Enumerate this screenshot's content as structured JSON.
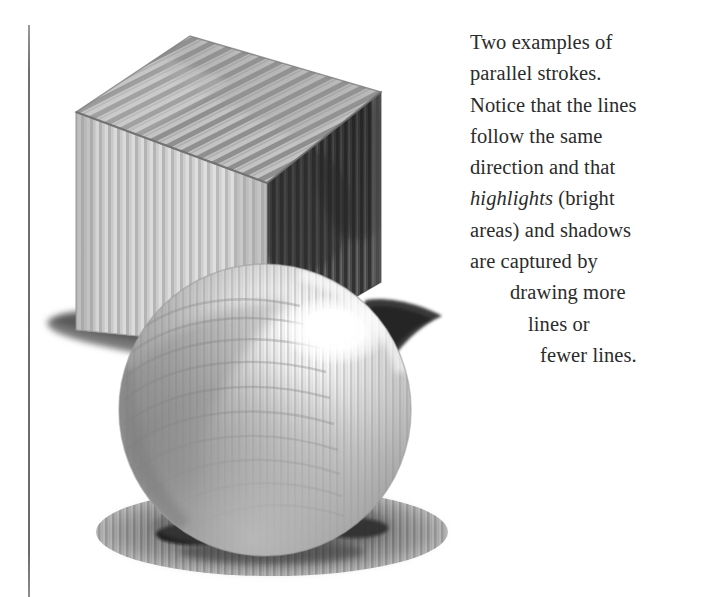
{
  "page": {
    "background_color": "#ffffff",
    "ink_color": "#2b2b2b"
  },
  "rule": {
    "name": "left-margin-rule",
    "color": "#6f6f6f"
  },
  "caption": {
    "lines": [
      {
        "text": "Two examples of",
        "indent": 0,
        "italic_word": ""
      },
      {
        "text": "parallel strokes.",
        "indent": 0,
        "italic_word": ""
      },
      {
        "text": "Notice that the lines",
        "indent": 0,
        "italic_word": ""
      },
      {
        "text": "follow the same",
        "indent": 0,
        "italic_word": ""
      },
      {
        "text": "direction and that",
        "indent": 0,
        "italic_word": ""
      },
      {
        "text": "highlights (bright",
        "indent": 0,
        "italic_word": "highlights"
      },
      {
        "text": "areas) and shadows",
        "indent": 0,
        "italic_word": ""
      },
      {
        "text": "are captured by",
        "indent": 0,
        "italic_word": ""
      },
      {
        "text": "drawing more",
        "indent": 1,
        "italic_word": ""
      },
      {
        "text": "lines or",
        "indent": 2,
        "italic_word": ""
      },
      {
        "text": "fewer lines.",
        "indent": 3,
        "italic_word": ""
      }
    ],
    "line_1": "Two examples of",
    "line_2": "parallel strokes.",
    "line_3": "Notice that the lines",
    "line_4": "follow the same",
    "line_5": "direction and that",
    "line_6_italic": "highlights",
    "line_6_rest": " (bright",
    "line_7": "areas) and shadows",
    "line_8": "are captured by",
    "line_9": "drawing more",
    "line_10": "lines or",
    "line_11": "fewer lines."
  },
  "illustration": {
    "title": "Cube and sphere rendered with parallel hatching strokes",
    "objects": [
      {
        "name": "cube",
        "description": "Box in three-quarter view; top face diagonal parallel strokes, front-left face light vertical strokes, right face dark vertical strokes",
        "faces": {
          "top": {
            "tone": "#b4b4b4",
            "stroke_direction": "diagonal",
            "stroke_color": "#8b8b8b"
          },
          "front": {
            "tone": "#d9d9d9",
            "stroke_direction": "vertical",
            "stroke_color": "#a9a9a9"
          },
          "right": {
            "tone": "#585858",
            "stroke_direction": "vertical",
            "stroke_color": "#3a3a3a"
          }
        }
      },
      {
        "name": "sphere",
        "description": "Sphere with curved parallel strokes following the form; bright specular highlight upper right, core shadow lower left",
        "highlight_tone": "#ffffff",
        "midtone": "#b9b9b9",
        "core_shadow": "#7e7e7e",
        "stroke_color": "#909090"
      },
      {
        "name": "cast-shadow-cube",
        "description": "Thin dark shadow extending left from cube base",
        "tone": "#6a6a6a"
      },
      {
        "name": "cast-shadow-wedge",
        "description": "Dark triangular shadow wedge emerging right of the sphere",
        "tone": "#4a4a4a"
      },
      {
        "name": "cast-shadow-sphere",
        "description": "Elliptical shadow pool beneath the sphere with two dark contact cores",
        "tone": "#7a7a7a",
        "core_tone": "#111111"
      }
    ],
    "palette": {
      "paper": "#ffffff",
      "light_grey": "#d9d9d9",
      "mid_grey": "#a8a8a8",
      "dark_grey": "#585858",
      "near_black": "#151515"
    }
  }
}
